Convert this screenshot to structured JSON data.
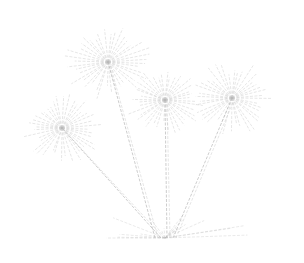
{
  "image": {
    "subject": "papyrus plant line drawing",
    "background": "#ffffff",
    "stroke_color": "#b8b8b8",
    "heads": [
      {
        "cx": 108,
        "cy": 62,
        "r": 45
      },
      {
        "cx": 62,
        "cy": 128,
        "r": 42
      },
      {
        "cx": 165,
        "cy": 100,
        "r": 40
      },
      {
        "cx": 232,
        "cy": 98,
        "r": 44
      }
    ],
    "base": {
      "x": 165,
      "y": 238
    }
  }
}
